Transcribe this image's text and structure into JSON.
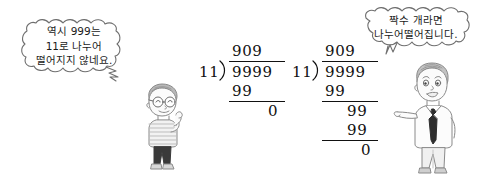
{
  "page": {
    "background_color": "#ffffff",
    "ink_color": "#111111",
    "width": 481,
    "height": 178
  },
  "bubbles": [
    {
      "id": "left",
      "speaker": "boy",
      "lines": [
        "역시 999는",
        "11로 나누어",
        "떨어지지 않네요."
      ]
    },
    {
      "id": "right",
      "speaker": "man",
      "lines": [
        "짝수 개라면",
        "나누어떨어집니다."
      ]
    }
  ],
  "divisions": [
    {
      "id": "left",
      "quotient": "909",
      "divisor": "11",
      "dividend": "9999",
      "steps": [
        "99",
        "0"
      ]
    },
    {
      "id": "right",
      "quotient": "909",
      "divisor": "11",
      "dividend": "9999",
      "steps": [
        "99",
        "99",
        "99",
        "0"
      ]
    }
  ],
  "characters": [
    {
      "id": "boy",
      "description": "소년"
    },
    {
      "id": "man",
      "description": "남자"
    }
  ]
}
